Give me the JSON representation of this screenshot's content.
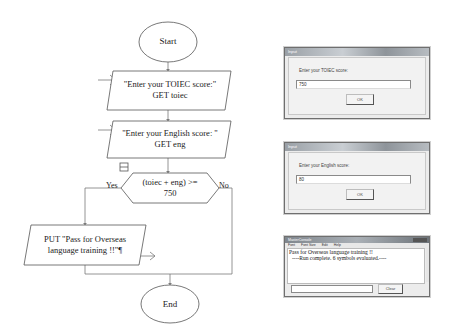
{
  "flowchart": {
    "start_label": "Start",
    "end_label": "End",
    "input1": {
      "line1": "\"Enter your TOIEC score:\"",
      "line2": "GET toiec"
    },
    "input2": {
      "line1": "\"Enter your English score: \"",
      "line2": "GET eng"
    },
    "decision": {
      "line1": "(toiec + eng) >=",
      "line2": "750",
      "yes_label": "Yes",
      "no_label": "No"
    },
    "output": {
      "line1": "PUT \"Pass for Overseas",
      "line2": "language training !!\"¶"
    },
    "line_color": "#7a7a7a",
    "shape_stroke": "#555555"
  },
  "dialogs": [
    {
      "title": "Input",
      "prompt": "Enter your TOIEC score:",
      "value": "750",
      "ok_label": "OK"
    },
    {
      "title": "Input",
      "prompt": "Enter your English score:",
      "value": "80",
      "ok_label": "OK"
    }
  ],
  "console": {
    "title": "MasterConsole",
    "menu": [
      "Font",
      "Font Size",
      "Edit",
      "Help"
    ],
    "output_line1": "Pass for Overseas language training !!",
    "output_line2": "----Run complete.  6 symbols evaluated.----",
    "clear_label": "Clear"
  }
}
